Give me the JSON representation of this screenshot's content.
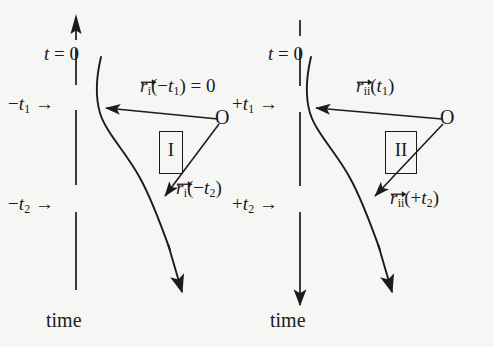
{
  "figure": {
    "background_color": "#f6f6f5",
    "ink_color": "#1b1b1b",
    "width": 494,
    "height": 347
  },
  "panels": [
    {
      "id": "panel-I",
      "box_label": "I",
      "time_axis": {
        "style": "dashed",
        "arrow_position": "top",
        "arrow_direction": "up",
        "caption": "time"
      },
      "origin_label": "O",
      "t_zero_label_t": "t",
      "t_zero_label_eq": "=",
      "t_zero_label_val": "0",
      "ticks": [
        {
          "name": "tick-minus-t1",
          "sign": "−",
          "symbol": "t",
          "sub": "1",
          "arrow": "→"
        },
        {
          "name": "tick-minus-t2",
          "sign": "−",
          "symbol": "t",
          "sub": "2",
          "arrow": "→"
        }
      ],
      "vectors": [
        {
          "name": "vector-r-i-minus-t1",
          "symbol": "r",
          "sub": "i",
          "open_paren": "(",
          "arg_sign": "−",
          "arg_symbol": "t",
          "arg_sub": "1",
          "close_paren": ")",
          "suffix": " = 0"
        },
        {
          "name": "vector-r-i-minus-t2",
          "symbol": "r",
          "sub": "i",
          "open_paren": "(",
          "arg_sign": "−",
          "arg_symbol": "t",
          "arg_sub": "2",
          "close_paren": ")",
          "suffix": ""
        }
      ]
    },
    {
      "id": "panel-II",
      "box_label": "II",
      "time_axis": {
        "style": "dashed-then-solid",
        "arrow_position": "bottom",
        "arrow_direction": "down",
        "caption": "time"
      },
      "origin_label": "O",
      "t_zero_label_t": "t",
      "t_zero_label_eq": "=",
      "t_zero_label_val": "0",
      "ticks": [
        {
          "name": "tick-plus-t1",
          "sign": "+",
          "symbol": "t",
          "sub": "1",
          "arrow": "→"
        },
        {
          "name": "tick-plus-t2",
          "sign": "+",
          "symbol": "t",
          "sub": "2",
          "arrow": "→"
        }
      ],
      "vectors": [
        {
          "name": "vector-r-ii-t1",
          "symbol": "r",
          "sub": "ii",
          "open_paren": "(",
          "arg_sign": "",
          "arg_symbol": "t",
          "arg_sub": "1",
          "close_paren": ")",
          "suffix": ""
        },
        {
          "name": "vector-r-ii-plus-t2",
          "symbol": "r",
          "sub": "ii",
          "open_paren": "(",
          "arg_sign": "+",
          "arg_symbol": "t",
          "arg_sub": "2",
          "close_paren": ")",
          "suffix": ""
        }
      ]
    }
  ]
}
